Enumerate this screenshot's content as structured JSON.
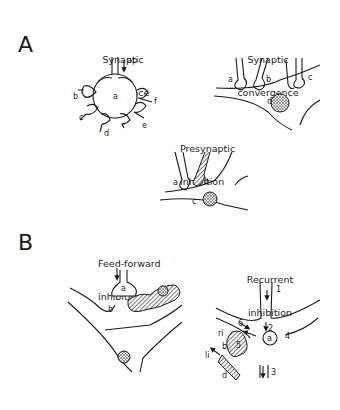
{
  "panels": {
    "A": {
      "letter": "A",
      "divergence": {
        "title_line1": "Synaptic",
        "title_line2": "divergence",
        "labels": {
          "ap": "ap",
          "a": "a",
          "b": "b",
          "c": "c",
          "d": "d",
          "e": "e",
          "f": "f"
        }
      },
      "convergence": {
        "title_line1": "Synaptic",
        "title_line2": "convergence",
        "labels": {
          "a": "a",
          "b": "b",
          "c": "c",
          "d": "d"
        }
      },
      "presynaptic": {
        "title_line1": "Presynaptic",
        "title_line2": "inhibition",
        "labels": {
          "a": "a",
          "b": "b",
          "c": "c"
        }
      }
    },
    "B": {
      "letter": "B",
      "feedforward": {
        "title_line1": "Feed-forward",
        "title_line2": "inhibition",
        "labels": {
          "a": "a",
          "b": "b"
        }
      },
      "recurrent": {
        "title_line1": "Recurrent",
        "title_line2": "inhibition",
        "labels": {
          "n1": "1",
          "n2": "2",
          "n3": "3",
          "n4": "4",
          "n5": "5",
          "n6": "6",
          "a": "a",
          "b": "b",
          "d": "d",
          "ri": "ri",
          "li": "li"
        }
      }
    }
  },
  "colors": {
    "ink": "#1a1a1a",
    "background": "#ffffff"
  }
}
